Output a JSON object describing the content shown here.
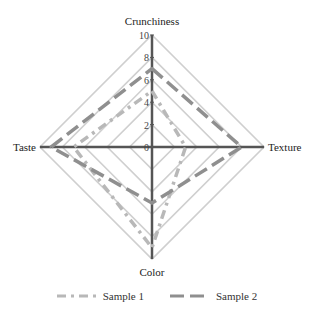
{
  "chart_data": {
    "type": "radar",
    "title": "",
    "axes": [
      "Crunchiness",
      "Texture",
      "Color",
      "Taste"
    ],
    "range": [
      0,
      10
    ],
    "ticks": [
      0,
      2,
      4,
      6,
      8,
      10
    ],
    "grid": true,
    "grid_levels": [
      2,
      4,
      6,
      8,
      10
    ],
    "legend_position": "bottom",
    "series": [
      {
        "name": "Sample 1",
        "values": [
          5,
          3,
          9,
          7
        ],
        "color": "#b8b8b8",
        "dash": "dash-dot"
      },
      {
        "name": "Sample 2",
        "values": [
          7,
          8,
          5,
          9
        ],
        "color": "#8f8f8f",
        "dash": "long-dash"
      }
    ]
  },
  "colors": {
    "axis": "#555555",
    "grid": "#cfcfcf"
  },
  "legend": {
    "items": [
      {
        "label": "Sample 1"
      },
      {
        "label": "Sample 2"
      }
    ]
  }
}
